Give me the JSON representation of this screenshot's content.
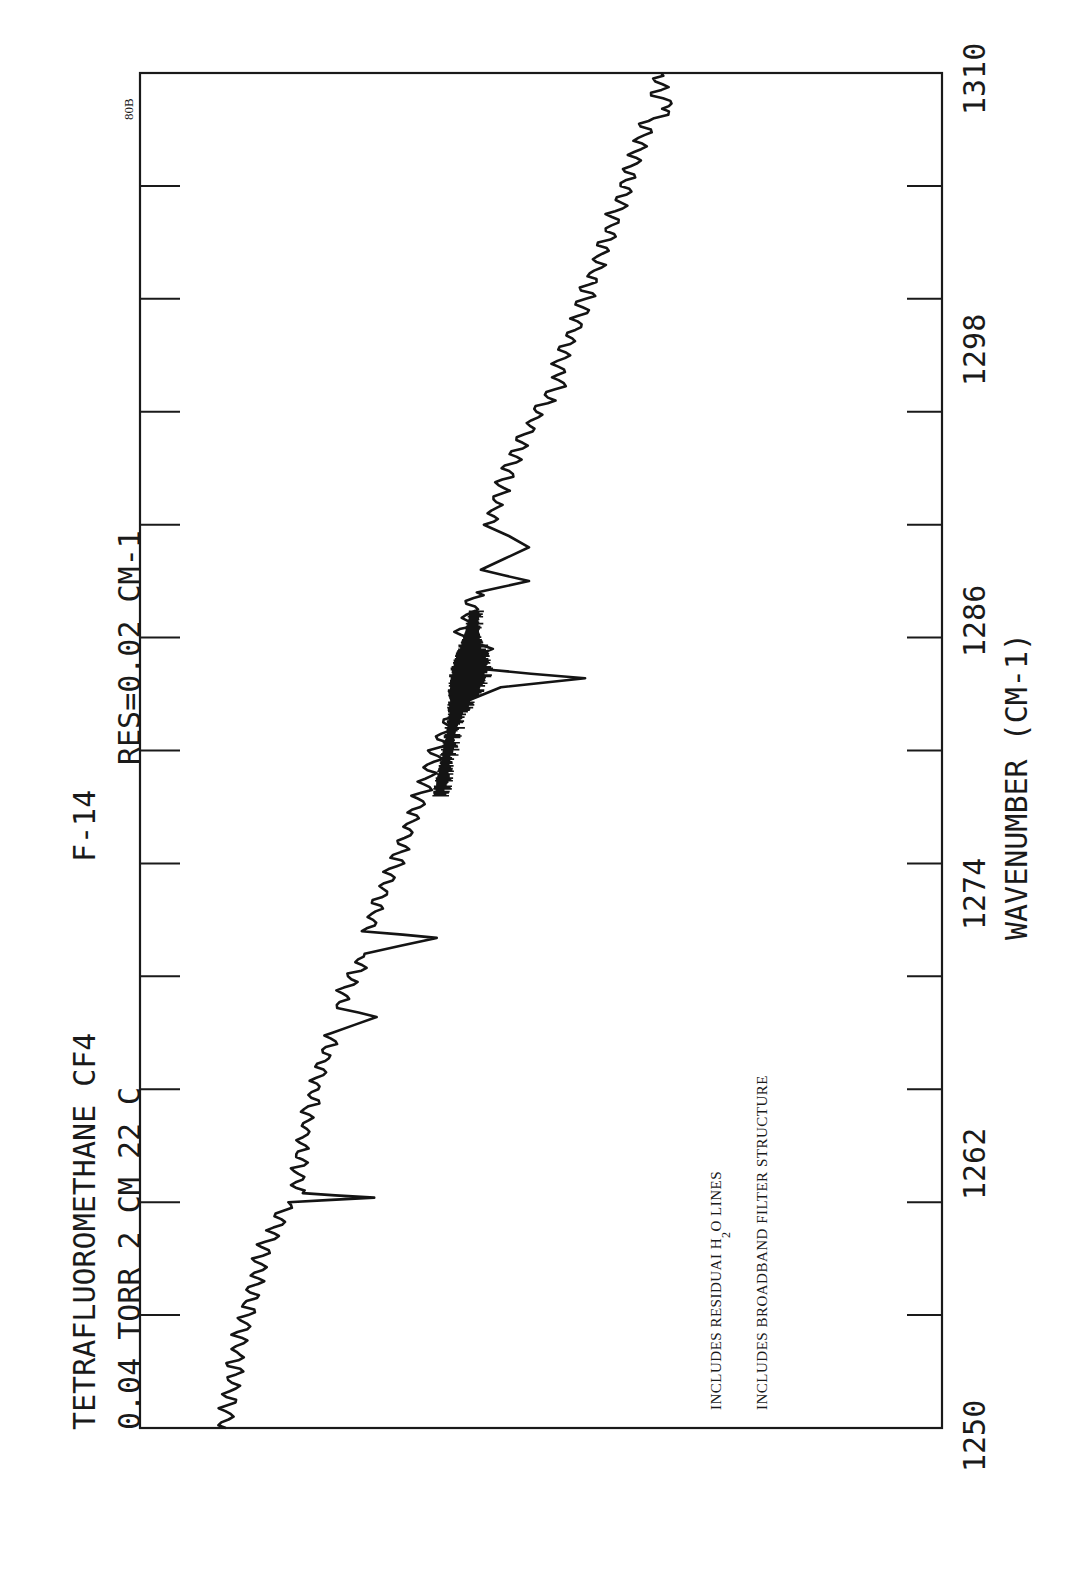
{
  "header": {
    "line1_left": "TETRAFLUOROMETHANE  CF4",
    "line1_right": "F-14",
    "line2_left": "0.04 TORR  2 CM  22 C",
    "line2_right": "RES=0.02    CM-1",
    "plate_id": "80B"
  },
  "annotation": {
    "line1_pre": "INCLUDES RESIDUAI  H",
    "line1_sub": "2",
    "line1_post": "O LINES",
    "line2": "INCLUDES BROADBAND FILTER STRUCTURE"
  },
  "axis": {
    "xlabel": "WAVENUMBER  (CM-1)",
    "ticks": [
      "1250",
      "1262",
      "1274",
      "1286",
      "1298",
      "1310"
    ]
  },
  "chart_data": {
    "type": "line",
    "title": "TETRAFLUOROMETHANE CF4  F-14",
    "subtitle": "0.04 TORR  2 CM  22 C   RES=0.02 CM-1",
    "xlabel": "WAVENUMBER (CM-1)",
    "ylabel": "",
    "xlim": [
      1250,
      1310
    ],
    "ylim": [
      0,
      100
    ],
    "x_ticks": [
      1250,
      1255,
      1262,
      1268,
      1274,
      1280,
      1286,
      1292,
      1298,
      1304,
      1310
    ],
    "x_tick_labels": [
      "1250",
      "1262",
      "1274",
      "1286",
      "1298",
      "1310"
    ],
    "grid": false,
    "orientation": "rotated 90 degrees (wavenumber axis vertical, increasing upward)",
    "annotations": [
      "INCLUDES RESIDUAI H2O LINES",
      "INCLUDES BROADBAND FILTER STRUCTURE",
      "80B"
    ],
    "series": [
      {
        "name": "CF4 transmission (arb. units)",
        "x": [
          1250.0,
          1252.0,
          1254.0,
          1256.0,
          1258.0,
          1259.5,
          1260.0,
          1260.2,
          1260.4,
          1261.0,
          1262.0,
          1264.0,
          1266.0,
          1267.5,
          1268.2,
          1268.6,
          1269.0,
          1270.0,
          1271.0,
          1271.7,
          1272.0,
          1273.0,
          1275.0,
          1277.0,
          1279.0,
          1280.0,
          1281.0,
          1282.0,
          1282.8,
          1283.2,
          1283.6,
          1284.0,
          1284.5,
          1285.0,
          1286.0,
          1287.0,
          1287.5,
          1288.0,
          1289.0,
          1290.0,
          1292.0,
          1294.0,
          1296.0,
          1296.4,
          1297.0,
          1299.0,
          1301.0,
          1303.0,
          1305.0,
          1307.0,
          1308.0,
          1308.3,
          1309.0,
          1310.0
        ],
        "values": [
          89.5,
          88.5,
          87.5,
          86.0,
          84.5,
          82.0,
          81.5,
          70.8,
          80.5,
          80.3,
          80.0,
          79.0,
          77.5,
          76.0,
          70.5,
          75.0,
          74.8,
          73.5,
          72.0,
          63.0,
          71.5,
          70.5,
          68.0,
          66.0,
          64.0,
          63.0,
          62.0,
          60.5,
          55.0,
          44.5,
          58.0,
          59.5,
          56.0,
          60.0,
          59.0,
          58.0,
          51.5,
          57.5,
          51.5,
          56.5,
          54.5,
          52.0,
          48.5,
          47.3,
          48.0,
          45.5,
          43.5,
          41.5,
          39.5,
          37.5,
          36.5,
          33.5,
          35.5,
          35.0
        ]
      }
    ]
  }
}
